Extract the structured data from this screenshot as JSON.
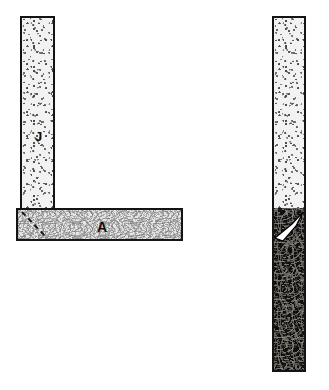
{
  "figure": {
    "canvas": {
      "width": 329,
      "height": 390,
      "background": "#ffffff"
    },
    "members": [
      {
        "id": "member-j",
        "label": "J",
        "orientation": "vertical",
        "texture": "coarse-speckle-light",
        "fill_color": "#f2f2f2",
        "border_color": "#141414",
        "x": 20,
        "y": 16,
        "width": 35,
        "height": 194,
        "label_x": 33,
        "label_y": 128,
        "label_size": 13
      },
      {
        "id": "member-a",
        "label": "A",
        "orientation": "horizontal",
        "texture": "fine-marble-light",
        "fill_color": "#e6e6e6",
        "border_color": "#141414",
        "x": 16,
        "y": 208,
        "width": 167,
        "height": 33,
        "label_x": 95,
        "label_y": 218,
        "label_size": 14
      },
      {
        "id": "member-k",
        "label": "",
        "orientation": "vertical",
        "texture": "split-speckle-over-dark-marble",
        "fill_color": "#f2f2f2",
        "fill_color_lower": "#100f0e",
        "border_color": "#141414",
        "x": 272,
        "y": 16,
        "width": 34,
        "height": 356,
        "split_y": 208
      }
    ],
    "annotations": [
      {
        "id": "miter-dashed-line",
        "type": "dashed-line",
        "color": "#1a1a1a",
        "x1": 22,
        "y1": 212,
        "x2": 47,
        "y2": 238,
        "dash": "5,4",
        "width": 2
      },
      {
        "id": "white-arrow",
        "type": "arrow",
        "color": "#ffffff",
        "outline_color": "#000000",
        "points": "275,238 292,224 303,212 296,226 283,241",
        "direction": "up-right"
      }
    ],
    "colors": {
      "background": "#ffffff",
      "ink": "#141414",
      "light_fill": "#f2f2f2",
      "mid_fill": "#e6e6e6",
      "dark_fill": "#100f0e",
      "annotation_white": "#ffffff"
    }
  }
}
